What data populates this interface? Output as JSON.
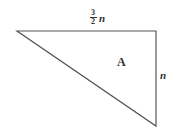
{
  "diagram": {
    "type": "right-triangle",
    "shape_name": "triangle",
    "stroke_color": "#555555",
    "vertices": {
      "left": [
        17,
        31
      ],
      "top_right": [
        156,
        31
      ],
      "bottom_right": [
        156,
        126
      ]
    },
    "labels": {
      "top_side": {
        "coefficient_numerator": "3",
        "coefficient_denominator": "2",
        "variable": "n"
      },
      "right_side": {
        "variable": "n"
      },
      "region": "A"
    }
  }
}
